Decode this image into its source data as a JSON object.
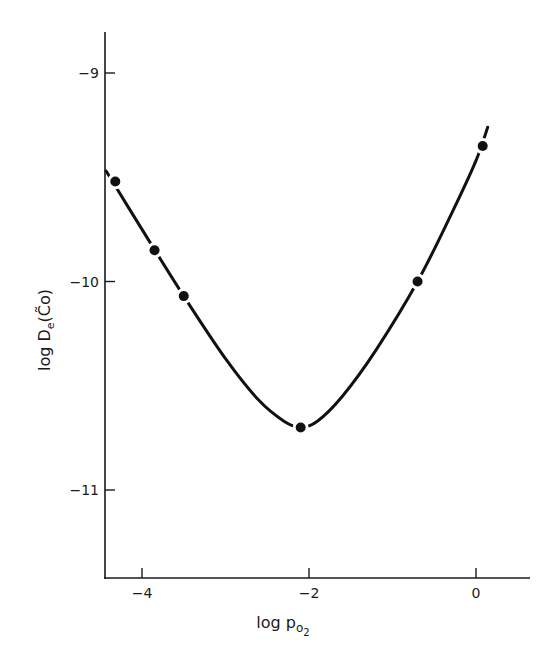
{
  "chart_data": {
    "type": "line",
    "title": "",
    "xlabel": "log p_O2",
    "ylabel": "log De(C~o)",
    "xlabel_parts": {
      "main": "log p",
      "sub": "O",
      "subsub": "2"
    },
    "ylabel_parts": {
      "main": "log D",
      "sub": "e",
      "paren": "(C̃o)"
    },
    "xlim": [
      -4.45,
      0.65
    ],
    "ylim": [
      -11.42,
      -8.79
    ],
    "x_ticks": [
      -4,
      -2,
      0
    ],
    "x_tick_labels": [
      "−4",
      "−2",
      "0"
    ],
    "y_ticks": [
      -9,
      -10,
      -11
    ],
    "y_tick_labels": [
      "−9",
      "−10",
      "−11"
    ],
    "grid": false,
    "legend": null,
    "series": [
      {
        "name": "measured",
        "style": "markers",
        "x": [
          -4.32,
          -3.85,
          -3.5,
          -2.1,
          -0.7,
          0.08
        ],
        "y": [
          -9.52,
          -9.85,
          -10.07,
          -10.7,
          -10.0,
          -9.35
        ]
      },
      {
        "name": "fitted-curve",
        "style": "line",
        "x": [
          -4.43,
          -4.0,
          -3.5,
          -3.0,
          -2.6,
          -2.3,
          -2.1,
          -1.9,
          -1.6,
          -1.2,
          -0.7,
          -0.3,
          0.0,
          0.14
        ],
        "y": [
          -9.47,
          -9.75,
          -10.07,
          -10.37,
          -10.57,
          -10.67,
          -10.7,
          -10.67,
          -10.55,
          -10.33,
          -10.0,
          -9.68,
          -9.42,
          -9.26
        ]
      }
    ]
  }
}
